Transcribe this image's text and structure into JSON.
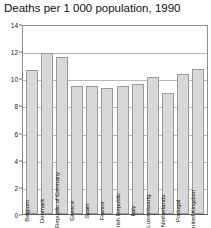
{
  "chart_data": {
    "type": "bar",
    "title": "Deaths per 1 000 population, 1990",
    "xlabel": "",
    "ylabel": "",
    "ylim": [
      0,
      14
    ],
    "yticks": [
      0,
      2,
      4,
      6,
      8,
      10,
      12,
      14
    ],
    "grid": true,
    "legend": "none",
    "categories": [
      "Belgium",
      "Denmark",
      "Federal Republic of Germany",
      "Greece",
      "Spain",
      "France",
      "Irish Republic",
      "Italy",
      "Luxembourg",
      "Netherlands",
      "Portugal",
      "United Kingdom"
    ],
    "values": [
      10.6,
      11.9,
      11.6,
      9.4,
      9.4,
      9.3,
      9.4,
      9.6,
      10.1,
      8.9,
      10.3,
      10.7
    ],
    "bar_color": "#d8d8d8",
    "bar_border_color": "#9a9a9a",
    "grid_color": "#b8b8b8",
    "axis_color": "#5a5a5a",
    "background": "#ffffff",
    "text_color": "#111111"
  }
}
